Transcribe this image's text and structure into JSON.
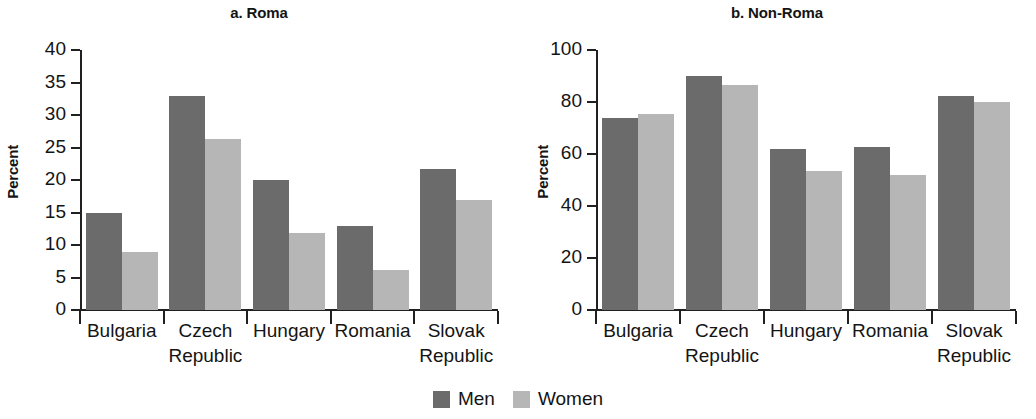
{
  "legend": {
    "items": [
      {
        "label": "Men",
        "color": "#6b6b6b"
      },
      {
        "label": "Women",
        "color": "#b6b6b6"
      }
    ]
  },
  "chart_data": [
    {
      "type": "bar",
      "title": "a. Roma",
      "xlabel": "",
      "ylabel": "Percent",
      "ylim": [
        0,
        40
      ],
      "yticks": [
        0,
        5,
        10,
        15,
        20,
        25,
        30,
        35,
        40
      ],
      "grid": false,
      "legend_position": "bottom-center",
      "categories": [
        "Bulgaria",
        "Czech\nRepublic",
        "Hungary",
        "Romania",
        "Slovak\nRepublic"
      ],
      "series": [
        {
          "name": "Men",
          "color": "#6b6b6b",
          "values": [
            15,
            33,
            20,
            13,
            21.7
          ]
        },
        {
          "name": "Women",
          "color": "#b6b6b6",
          "values": [
            9,
            26.3,
            11.8,
            6.2,
            17
          ]
        }
      ]
    },
    {
      "type": "bar",
      "title": "b. Non-Roma",
      "xlabel": "",
      "ylabel": "Percent",
      "ylim": [
        0,
        100
      ],
      "yticks": [
        0,
        20,
        40,
        60,
        80,
        100
      ],
      "grid": false,
      "legend_position": "bottom-center",
      "categories": [
        "Bulgaria",
        "Czech\nRepublic",
        "Hungary",
        "Romania",
        "Slovak\nRepublic"
      ],
      "series": [
        {
          "name": "Men",
          "color": "#6b6b6b",
          "values": [
            74,
            90,
            62,
            62.8,
            82.5
          ]
        },
        {
          "name": "Women",
          "color": "#b6b6b6",
          "values": [
            75.5,
            86.5,
            53.5,
            52,
            80
          ]
        }
      ]
    }
  ]
}
